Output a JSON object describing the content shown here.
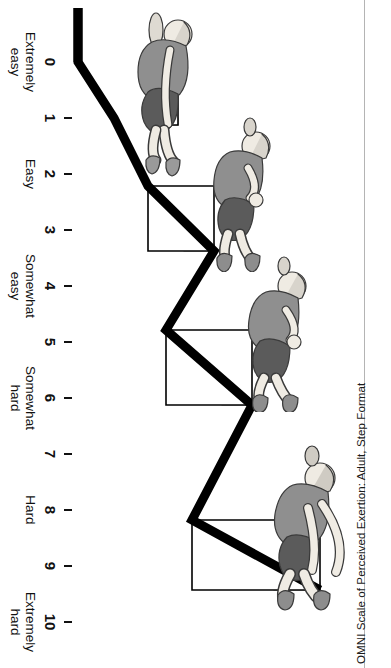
{
  "figure": {
    "caption": "OMNI Scale of Perceived Exertion: Adult, Step Format",
    "title_short": "OMNI Scale of Perceived Exertion",
    "variant": "Adult, Step Format",
    "orientation_note": "rotated"
  },
  "colors": {
    "ramp": "#000000",
    "text": "#111111",
    "rule": "#b4b4b4",
    "background": "#ffffff",
    "figure_shirt": "#8c8c8c",
    "figure_shorts": "#5a5a5a",
    "figure_skin": "#f2efe9",
    "figure_outline": "#333333",
    "step_riser": "#b8b8b8"
  },
  "chart_data": {
    "type": "bar",
    "title": "OMNI Scale of Perceived Exertion: Adult, Step Format",
    "xlabel": "",
    "ylabel": "",
    "xlim": [
      0,
      10
    ],
    "ylim": [
      0,
      10
    ],
    "grid": false,
    "legend": null,
    "categories": [
      "0",
      "1",
      "2",
      "3",
      "4",
      "5",
      "6",
      "7",
      "8",
      "9",
      "10"
    ],
    "values": [
      0,
      1,
      2,
      3,
      4,
      5,
      6,
      7,
      8,
      9,
      10
    ],
    "tick_labels": [
      "0",
      "1",
      "2",
      "3",
      "4",
      "5",
      "6",
      "7",
      "8",
      "9",
      "10"
    ],
    "anchors": [
      {
        "value": 0,
        "label": "Extremely\neasy"
      },
      {
        "value": 2,
        "label": "Easy"
      },
      {
        "value": 4,
        "label": "Somewhat\neasy"
      },
      {
        "value": 6,
        "label": "Somewhat\nhard"
      },
      {
        "value": 8,
        "label": "Hard"
      },
      {
        "value": 10,
        "label": "Extremely\nhard"
      }
    ],
    "figures": [
      {
        "at_value": 0,
        "posture": "seated-upright-relaxed",
        "label": "exerciser-level-0"
      },
      {
        "at_value": 3,
        "posture": "leaning-back-light",
        "label": "exerciser-level-3"
      },
      {
        "at_value": 6,
        "posture": "leaning-back-moderate",
        "label": "exerciser-level-6"
      },
      {
        "at_value": 10,
        "posture": "straining-arms-forward",
        "label": "exerciser-level-10"
      }
    ]
  },
  "ticks": [
    {
      "n": "0",
      "x": 62,
      "major": true
    },
    {
      "n": "1",
      "x": 118,
      "major": false
    },
    {
      "n": "2",
      "x": 174,
      "major": false
    },
    {
      "n": "3",
      "x": 230,
      "major": false
    },
    {
      "n": "4",
      "x": 286,
      "major": false
    },
    {
      "n": "5",
      "x": 342,
      "major": false
    },
    {
      "n": "6",
      "x": 398,
      "major": false
    },
    {
      "n": "7",
      "x": 454,
      "major": false
    },
    {
      "n": "8",
      "x": 510,
      "major": false
    },
    {
      "n": "9",
      "x": 566,
      "major": false
    },
    {
      "n": "10",
      "x": 622,
      "major": false
    }
  ],
  "anchor_labels": [
    {
      "text": "Extremely\neasy",
      "x": 62
    },
    {
      "text": "Easy",
      "x": 174
    },
    {
      "text": "Somewhat\neasy",
      "x": 286
    },
    {
      "text": "Somewhat\nhard",
      "x": 398
    },
    {
      "text": "Hard",
      "x": 510
    },
    {
      "text": "Extremely\nhard",
      "x": 622
    }
  ]
}
